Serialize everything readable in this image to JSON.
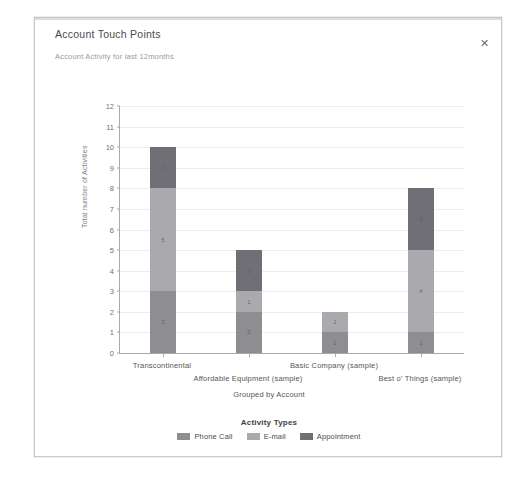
{
  "background_strip_text": "",
  "dialog": {
    "title": "Account Touch Points",
    "subtitle": "Account Activity for last 12months",
    "close_label": "✕",
    "close_icon": "close-icon"
  },
  "chart_data": {
    "type": "bar",
    "subtype": "stacked-bar",
    "title": "Account Touch Points",
    "subtitle": "Account Activity for last 12months",
    "xlabel": "Grouped by Account",
    "ylabel": "Total number of Activities",
    "ylim": [
      0,
      12
    ],
    "yticks": [
      0,
      1,
      2,
      3,
      4,
      5,
      6,
      7,
      8,
      9,
      10,
      11,
      12
    ],
    "ytick_labels": [
      "0",
      "1",
      "2",
      "3",
      "4",
      "5",
      "6",
      "7",
      "8",
      "9",
      "10",
      "11",
      "12"
    ],
    "grid": true,
    "legend_title": "Activity Types",
    "legend_position": "bottom",
    "categories": [
      "Transcontinental",
      "Affordable  Equipment (sample)",
      "Basic  Company (sample)",
      "Best o'  Things (sample)"
    ],
    "series": [
      {
        "name": "Phone Call",
        "color": "#8d8d92",
        "values": [
          3,
          2,
          1,
          1
        ]
      },
      {
        "name": "E-mail",
        "color": "#a9a9ae",
        "values": [
          5,
          1,
          1,
          4
        ]
      },
      {
        "name": "Appointment",
        "color": "#6f6f75",
        "values": [
          2,
          2,
          0,
          3
        ]
      }
    ],
    "totals": [
      10,
      5,
      2,
      8
    ],
    "bar_labels": [
      [
        "3",
        "5",
        "2"
      ],
      [
        "2",
        "1",
        "2"
      ],
      [
        "1",
        "1",
        ""
      ],
      [
        "1",
        "4",
        "3"
      ]
    ]
  }
}
